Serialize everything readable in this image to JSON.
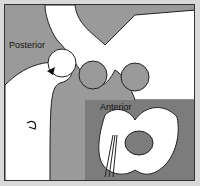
{
  "diagram": {
    "labels": {
      "posterior": "Posterior",
      "anterior": "Anterior"
    },
    "colors": {
      "background": "#9a9a9a",
      "inset": "#7c7c7c",
      "bone": "#ffffff",
      "outline": "#222222"
    }
  }
}
